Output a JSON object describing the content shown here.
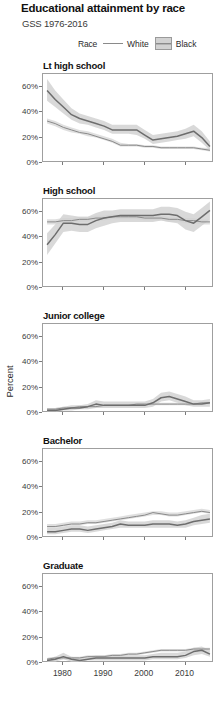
{
  "header": {
    "title": "Educational attainment by race",
    "subtitle": "GSS 1976-2016"
  },
  "legend": {
    "title": "Race",
    "white_label": "White",
    "black_label": "Black",
    "white_color": "#8a8a8a",
    "black_color": "#6d6d6d",
    "band_color": "#d2d2d2"
  },
  "axis": {
    "ylabel": "Percent",
    "yticks": [
      "0%",
      "20%",
      "40%",
      "60%"
    ],
    "ytick_values": [
      0,
      20,
      40,
      60
    ],
    "xticks": [
      "1980",
      "1990",
      "2000",
      "2010"
    ],
    "xtick_values": [
      1980,
      1990,
      2000,
      2010
    ],
    "xlim": [
      1975,
      2017
    ],
    "ylim": [
      0,
      70
    ]
  },
  "chart_data": {
    "type": "line",
    "title": "Educational attainment by race",
    "subtitle": "GSS 1976-2016",
    "xlabel": "",
    "ylabel": "Percent",
    "xlim": [
      1975,
      2017
    ],
    "ylim": [
      0,
      70
    ],
    "grid": false,
    "legend_position": "top",
    "facet_variable": "degree",
    "series_variable": "race",
    "bands": "95% confidence interval",
    "panels": [
      {
        "label": "Lt high school",
        "x": [
          1976,
          1978,
          1980,
          1982,
          1984,
          1986,
          1988,
          1990,
          1992,
          1994,
          1996,
          1998,
          2000,
          2002,
          2004,
          2006,
          2008,
          2010,
          2012,
          2014,
          2016
        ],
        "series": [
          {
            "name": "White",
            "values": [
              33,
              31,
              28,
              26,
              24,
              23,
              21,
              19,
              17,
              14,
              14,
              14,
              13,
              13,
              12,
              12,
              12,
              12,
              12,
              11,
              10
            ],
            "lower": [
              31,
              29,
              26,
              24,
              23,
              21,
              20,
              18,
              16,
              13,
              13,
              13,
              12,
              12,
              11,
              11,
              11,
              11,
              11,
              10,
              9
            ],
            "upper": [
              35,
              33,
              30,
              28,
              26,
              25,
              23,
              21,
              19,
              16,
              15,
              15,
              14,
              14,
              13,
              13,
              13,
              13,
              13,
              12,
              12
            ]
          },
          {
            "name": "Black",
            "values": [
              57,
              50,
              44,
              38,
              35,
              33,
              31,
              29,
              26,
              26,
              26,
              26,
              22,
              18,
              19,
              20,
              21,
              23,
              25,
              20,
              13
            ],
            "lower": [
              49,
              44,
              39,
              34,
              31,
              30,
              28,
              26,
              23,
              23,
              23,
              22,
              19,
              15,
              16,
              17,
              18,
              19,
              21,
              16,
              10
            ],
            "upper": [
              66,
              57,
              50,
              43,
              39,
              37,
              35,
              33,
              30,
              30,
              30,
              30,
              26,
              22,
              23,
              24,
              25,
              27,
              30,
              25,
              17
            ]
          }
        ]
      },
      {
        "label": "High school",
        "x": [
          1976,
          1978,
          1980,
          1982,
          1984,
          1986,
          1988,
          1990,
          1992,
          1994,
          1996,
          1998,
          2000,
          2002,
          2004,
          2006,
          2008,
          2010,
          2012,
          2014,
          2016
        ],
        "series": [
          {
            "name": "White",
            "values": [
              52,
              52,
              53,
              53,
              54,
              54,
              55,
              55,
              56,
              56,
              56,
              56,
              55,
              55,
              55,
              54,
              54,
              53,
              53,
              52,
              52
            ],
            "lower": [
              50,
              50,
              51,
              51,
              52,
              52,
              53,
              53,
              54,
              54,
              54,
              54,
              53,
              53,
              53,
              52,
              52,
              51,
              51,
              50,
              50
            ],
            "upper": [
              54,
              54,
              55,
              55,
              56,
              56,
              57,
              57,
              58,
              58,
              58,
              58,
              57,
              57,
              57,
              56,
              56,
              55,
              55,
              54,
              54
            ]
          },
          {
            "name": "Black",
            "values": [
              34,
              42,
              51,
              51,
              50,
              50,
              53,
              55,
              56,
              57,
              57,
              57,
              57,
              57,
              58,
              58,
              57,
              53,
              51,
              56,
              61
            ],
            "lower": [
              26,
              35,
              44,
              45,
              44,
              44,
              47,
              49,
              51,
              52,
              52,
              52,
              52,
              52,
              53,
              52,
              51,
              46,
              44,
              49,
              54
            ],
            "upper": [
              43,
              50,
              58,
              57,
              56,
              56,
              59,
              61,
              61,
              62,
              62,
              62,
              62,
              62,
              64,
              64,
              63,
              60,
              58,
              63,
              68
            ]
          }
        ]
      },
      {
        "label": "Junior college",
        "x": [
          1976,
          1978,
          1980,
          1982,
          1984,
          1986,
          1988,
          1990,
          1992,
          1994,
          1996,
          1998,
          2000,
          2002,
          2004,
          2006,
          2008,
          2010,
          2012,
          2014,
          2016
        ],
        "series": [
          {
            "name": "White",
            "values": [
              3,
              3,
              4,
              4,
              5,
              5,
              5,
              6,
              6,
              6,
              6,
              7,
              7,
              7,
              7,
              7,
              7,
              7,
              7,
              8,
              8
            ],
            "lower": [
              2,
              2,
              3,
              3,
              4,
              4,
              4,
              5,
              5,
              5,
              5,
              6,
              6,
              6,
              6,
              6,
              6,
              6,
              6,
              7,
              7
            ],
            "upper": [
              4,
              4,
              5,
              5,
              6,
              6,
              6,
              7,
              7,
              7,
              7,
              8,
              8,
              8,
              8,
              8,
              8,
              8,
              8,
              9,
              9
            ]
          },
          {
            "name": "Black",
            "values": [
              2,
              2,
              3,
              4,
              4,
              5,
              7,
              6,
              6,
              6,
              6,
              6,
              6,
              8,
              12,
              13,
              11,
              9,
              7,
              7,
              8
            ],
            "lower": [
              1,
              1,
              2,
              2,
              3,
              3,
              4,
              4,
              4,
              4,
              4,
              4,
              4,
              5,
              9,
              10,
              8,
              6,
              5,
              5,
              5
            ],
            "upper": [
              4,
              4,
              5,
              6,
              6,
              7,
              10,
              9,
              9,
              9,
              9,
              9,
              9,
              11,
              16,
              17,
              15,
              13,
              10,
              10,
              11
            ]
          }
        ]
      },
      {
        "label": "Bachelor",
        "x": [
          1976,
          1978,
          1980,
          1982,
          1984,
          1986,
          1988,
          1990,
          1992,
          1994,
          1996,
          1998,
          2000,
          2002,
          2004,
          2006,
          2008,
          2010,
          2012,
          2014,
          2016
        ],
        "series": [
          {
            "name": "White",
            "values": [
              9,
              9,
              10,
              11,
              11,
              12,
              12,
              13,
              14,
              15,
              16,
              17,
              18,
              20,
              19,
              18,
              18,
              19,
              20,
              21,
              20
            ],
            "lower": [
              8,
              8,
              9,
              10,
              10,
              11,
              11,
              12,
              13,
              14,
              15,
              16,
              17,
              18,
              18,
              17,
              17,
              18,
              19,
              20,
              19
            ],
            "upper": [
              11,
              11,
              12,
              13,
              13,
              14,
              14,
              15,
              16,
              17,
              18,
              19,
              20,
              21,
              21,
              20,
              20,
              21,
              22,
              23,
              22
            ]
          },
          {
            "name": "Black",
            "values": [
              5,
              5,
              6,
              7,
              7,
              6,
              7,
              8,
              9,
              11,
              10,
              10,
              10,
              11,
              11,
              11,
              10,
              11,
              13,
              14,
              15
            ],
            "lower": [
              3,
              3,
              4,
              5,
              5,
              4,
              5,
              6,
              7,
              8,
              8,
              8,
              8,
              8,
              8,
              8,
              8,
              8,
              10,
              11,
              12
            ],
            "upper": [
              8,
              8,
              9,
              10,
              10,
              9,
              10,
              11,
              12,
              14,
              13,
              13,
              13,
              14,
              14,
              14,
              13,
              14,
              16,
              18,
              19
            ]
          }
        ]
      },
      {
        "label": "Graduate",
        "x": [
          1976,
          1978,
          1980,
          1982,
          1984,
          1986,
          1988,
          1990,
          1992,
          1994,
          1996,
          1998,
          2000,
          2002,
          2004,
          2006,
          2008,
          2010,
          2012,
          2014,
          2016
        ],
        "series": [
          {
            "name": "White",
            "values": [
              3,
              4,
              4,
              4,
              4,
              5,
              5,
              5,
              6,
              6,
              7,
              7,
              8,
              9,
              10,
              10,
              10,
              10,
              11,
              11,
              11
            ],
            "lower": [
              2,
              3,
              3,
              3,
              3,
              4,
              4,
              4,
              5,
              5,
              6,
              6,
              7,
              8,
              9,
              9,
              9,
              9,
              10,
              10,
              10
            ],
            "upper": [
              4,
              5,
              5,
              5,
              5,
              6,
              6,
              6,
              7,
              7,
              8,
              8,
              9,
              10,
              11,
              11,
              11,
              11,
              12,
              12,
              12
            ]
          },
          {
            "name": "Black",
            "values": [
              2,
              3,
              5,
              3,
              2,
              3,
              4,
              4,
              4,
              4,
              4,
              4,
              4,
              5,
              5,
              5,
              5,
              6,
              9,
              10,
              7
            ],
            "lower": [
              1,
              1,
              3,
              1,
              1,
              2,
              2,
              2,
              2,
              2,
              2,
              2,
              2,
              3,
              3,
              3,
              3,
              4,
              6,
              7,
              5
            ],
            "upper": [
              4,
              5,
              8,
              5,
              4,
              5,
              6,
              6,
              6,
              6,
              6,
              6,
              6,
              7,
              8,
              8,
              8,
              9,
              12,
              13,
              10
            ]
          }
        ]
      }
    ]
  }
}
